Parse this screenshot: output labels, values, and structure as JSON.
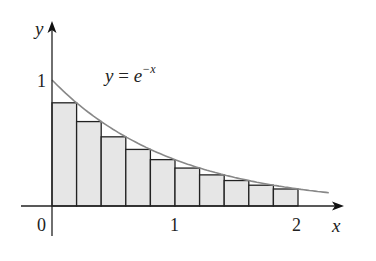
{
  "chart_data": {
    "type": "bar",
    "title": "",
    "xlabel": "x",
    "ylabel": "y",
    "function_label": "y = e^{-x}",
    "function_label_parts": {
      "lhs": "y = e",
      "exp": "−x"
    },
    "x_ticks": [
      {
        "value": 0,
        "label": "0"
      },
      {
        "value": 1,
        "label": "1"
      },
      {
        "value": 2,
        "label": "2"
      }
    ],
    "y_ticks": [
      {
        "value": 1,
        "label": "1"
      }
    ],
    "xlim": [
      -0.25,
      2.35
    ],
    "ylim": [
      -0.25,
      1.45
    ],
    "curve": {
      "expr": "exp(-x)",
      "x_range": [
        0,
        2.25
      ],
      "color": "#888888"
    },
    "bar_fill": "#e6e6e6",
    "bar_edge": "#222222",
    "bar_width": 0.2,
    "categories": [
      "0–0.2",
      "0.2–0.4",
      "0.4–0.6",
      "0.6–0.8",
      "0.8–1.0",
      "1.0–1.2",
      "1.2–1.4",
      "1.4–1.6",
      "1.6–1.8",
      "1.8–2.0"
    ],
    "bars": [
      {
        "x0": 0.0,
        "x1": 0.2,
        "height": 0.819
      },
      {
        "x0": 0.2,
        "x1": 0.4,
        "height": 0.67
      },
      {
        "x0": 0.4,
        "x1": 0.6,
        "height": 0.549
      },
      {
        "x0": 0.6,
        "x1": 0.8,
        "height": 0.449
      },
      {
        "x0": 0.8,
        "x1": 1.0,
        "height": 0.368
      },
      {
        "x0": 1.0,
        "x1": 1.2,
        "height": 0.301
      },
      {
        "x0": 1.2,
        "x1": 1.4,
        "height": 0.247
      },
      {
        "x0": 1.4,
        "x1": 1.6,
        "height": 0.202
      },
      {
        "x0": 1.6,
        "x1": 1.8,
        "height": 0.165
      },
      {
        "x0": 1.8,
        "x1": 2.0,
        "height": 0.135
      }
    ],
    "values": [
      0.819,
      0.67,
      0.549,
      0.449,
      0.368,
      0.301,
      0.247,
      0.202,
      0.165,
      0.135
    ],
    "grid": false,
    "legend": "none"
  }
}
